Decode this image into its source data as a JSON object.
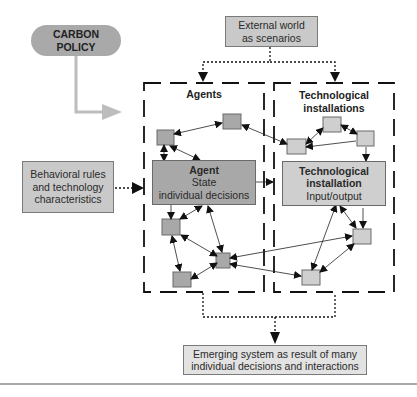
{
  "diagram": {
    "policy": {
      "line1": "CARBON",
      "line2": "POLICY"
    },
    "external": {
      "line1": "External world",
      "line2": "as scenarios"
    },
    "behavior": {
      "line1": "Behavioral rules",
      "line2": "and technology",
      "line3": "characteristics"
    },
    "agents_group": {
      "title": "Agents"
    },
    "tech_group": {
      "title_line1": "Technological",
      "title_line2": "installations"
    },
    "agent_node": {
      "title": "Agent",
      "line2": "State",
      "line3": "individual decisions"
    },
    "tech_node": {
      "title_line1": "Technological",
      "title_line2": "installation",
      "line3": "Input/output"
    },
    "emerging": {
      "line1": "Emerging system as result of many",
      "line2": "individual decisions and interactions"
    },
    "colors": {
      "box_fill": "#c9c9c9",
      "agent_fill": "#a8a8a8",
      "pill_fill": "#a9a9a9",
      "arrow_gray": "#bdbdbd",
      "line": "#111111"
    }
  }
}
